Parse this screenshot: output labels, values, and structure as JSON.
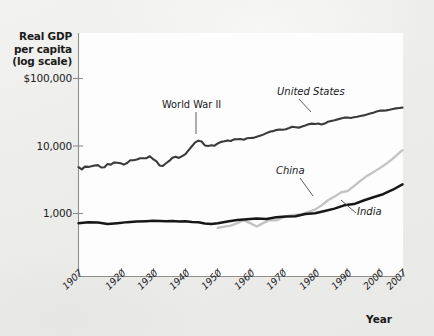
{
  "figure": {
    "background_color": "#eeeeec",
    "plot_background_color": "#fdfdfd",
    "axis_color": "#8e8e8e"
  },
  "chart_data": {
    "type": "line",
    "title": "",
    "ylabel": "Real GDP per capita (log scale)",
    "xlabel": "Year",
    "y_scale": "log",
    "ylim": [
      700,
      140000
    ],
    "xlim": [
      1907,
      2007
    ],
    "grid": false,
    "legend": "inline-annotations",
    "ytick_labels": [
      "$100,000",
      "10,000",
      "1,000"
    ],
    "ytick_values": [
      100000,
      10000,
      1000
    ],
    "xtick_labels": [
      "1907",
      "1920",
      "1930",
      "1940",
      "1950",
      "1960",
      "1970",
      "1980",
      "1990",
      "2000",
      "2007"
    ],
    "xtick_values": [
      1907,
      1920,
      1930,
      1940,
      1950,
      1960,
      1970,
      1980,
      1990,
      2000,
      2007
    ],
    "annotations": [
      {
        "text": "World War II",
        "x": 1944,
        "y": 13000,
        "note": "points to United States wartime peak"
      },
      {
        "text": "United States",
        "x": 1973,
        "y": 30000,
        "note": "series label with leader line"
      },
      {
        "text": "China",
        "x": 1977,
        "y": 2300,
        "note": "series label with leader line"
      },
      {
        "text": "India",
        "x": 1994,
        "y": 1450,
        "note": "series label with leader line"
      }
    ],
    "series": [
      {
        "name": "United States",
        "color": "#3a3a3a",
        "x": [
          1907,
          1908,
          1909,
          1910,
          1911,
          1912,
          1913,
          1914,
          1915,
          1916,
          1917,
          1918,
          1919,
          1920,
          1921,
          1922,
          1923,
          1924,
          1925,
          1926,
          1927,
          1928,
          1929,
          1930,
          1931,
          1932,
          1933,
          1934,
          1935,
          1936,
          1937,
          1938,
          1939,
          1940,
          1941,
          1942,
          1943,
          1944,
          1945,
          1946,
          1947,
          1948,
          1949,
          1950,
          1951,
          1952,
          1953,
          1954,
          1955,
          1956,
          1957,
          1958,
          1959,
          1960,
          1961,
          1962,
          1963,
          1964,
          1965,
          1966,
          1967,
          1968,
          1969,
          1970,
          1971,
          1972,
          1973,
          1974,
          1975,
          1976,
          1977,
          1978,
          1979,
          1980,
          1981,
          1982,
          1983,
          1984,
          1985,
          1986,
          1987,
          1988,
          1989,
          1990,
          1991,
          1992,
          1993,
          1994,
          1995,
          1996,
          1997,
          1998,
          1999,
          2000,
          2001,
          2002,
          2003,
          2004,
          2005,
          2006,
          2007
        ],
        "y": [
          4850,
          4500,
          4950,
          4900,
          5000,
          5150,
          5200,
          4800,
          4850,
          5400,
          5300,
          5700,
          5650,
          5550,
          5300,
          5600,
          6150,
          6150,
          6300,
          6600,
          6600,
          6600,
          7050,
          6400,
          5950,
          5150,
          5050,
          5550,
          6000,
          6700,
          6950,
          6650,
          7100,
          7600,
          8700,
          9900,
          11300,
          12000,
          11650,
          10200,
          10000,
          10250,
          10100,
          10900,
          11500,
          11750,
          12100,
          11850,
          12550,
          12600,
          12700,
          12400,
          13000,
          13150,
          13200,
          13750,
          14150,
          14750,
          15500,
          16300,
          16600,
          17200,
          17600,
          17400,
          17700,
          18450,
          19300,
          19000,
          18700,
          19500,
          20150,
          21050,
          21450,
          21200,
          21500,
          20800,
          21500,
          22850,
          23500,
          24100,
          24800,
          25600,
          26300,
          26500,
          26050,
          26650,
          27100,
          27900,
          28400,
          29200,
          30200,
          31200,
          32400,
          33400,
          33400,
          33700,
          34400,
          35400,
          36100,
          36600,
          37000
        ]
      },
      {
        "name": "China",
        "color": "#c2c2c2",
        "x": [
          1950,
          1952,
          1954,
          1956,
          1958,
          1960,
          1962,
          1964,
          1966,
          1968,
          1970,
          1972,
          1974,
          1976,
          1978,
          1980,
          1982,
          1984,
          1986,
          1988,
          1990,
          1992,
          1994,
          1996,
          1998,
          2000,
          2002,
          2004,
          2006,
          2007
        ],
        "y": [
          610,
          640,
          660,
          720,
          790,
          720,
          640,
          720,
          800,
          790,
          870,
          930,
          960,
          980,
          1060,
          1140,
          1320,
          1570,
          1780,
          2050,
          2150,
          2550,
          3050,
          3600,
          4100,
          4700,
          5450,
          6500,
          7900,
          8700
        ]
      },
      {
        "name": "India",
        "color": "#17171a",
        "x": [
          1907,
          1910,
          1913,
          1916,
          1919,
          1922,
          1925,
          1928,
          1930,
          1932,
          1934,
          1936,
          1938,
          1940,
          1942,
          1944,
          1946,
          1948,
          1950,
          1953,
          1956,
          1959,
          1962,
          1965,
          1968,
          1971,
          1974,
          1977,
          1980,
          1983,
          1986,
          1989,
          1992,
          1995,
          1998,
          2001,
          2004,
          2007
        ],
        "y": [
          720,
          740,
          735,
          700,
          720,
          745,
          760,
          770,
          780,
          775,
          770,
          775,
          760,
          765,
          750,
          740,
          710,
          700,
          715,
          760,
          800,
          820,
          840,
          830,
          880,
          900,
          910,
          980,
          1010,
          1090,
          1180,
          1320,
          1380,
          1560,
          1740,
          1930,
          2250,
          2700
        ]
      }
    ]
  }
}
